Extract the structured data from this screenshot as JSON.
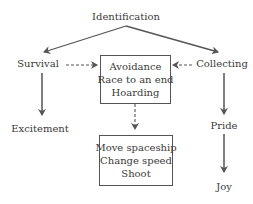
{
  "diagram": {
    "nodes": {
      "identification": "Identification",
      "survival": "Survival",
      "collecting": "Collecting",
      "excitement": "Excitement",
      "pride": "Pride",
      "joy": "Joy"
    },
    "boxes": {
      "mechanics_group": [
        "Avoidance",
        "Race to an end",
        "Hoarding"
      ],
      "actions_group": [
        "Move spaceship",
        "Change speed",
        "Shoot"
      ]
    },
    "edges": [
      {
        "from": "Identification",
        "to": "Survival",
        "style": "solid"
      },
      {
        "from": "Identification",
        "to": "Collecting",
        "style": "solid"
      },
      {
        "from": "Survival",
        "to": "Avoidance / Race to an end / Hoarding",
        "style": "dashed"
      },
      {
        "from": "Collecting",
        "to": "Avoidance / Race to an end / Hoarding",
        "style": "dashed"
      },
      {
        "from": "Avoidance / Race to an end / Hoarding",
        "to": "Move spaceship / Change speed / Shoot",
        "style": "dashed"
      },
      {
        "from": "Survival",
        "to": "Excitement",
        "style": "solid"
      },
      {
        "from": "Collecting",
        "to": "Pride",
        "style": "solid"
      },
      {
        "from": "Pride",
        "to": "Joy",
        "style": "solid"
      }
    ],
    "colors": {
      "line": "#555555",
      "text": "#3a3a3a",
      "background": "#ffffff"
    }
  }
}
